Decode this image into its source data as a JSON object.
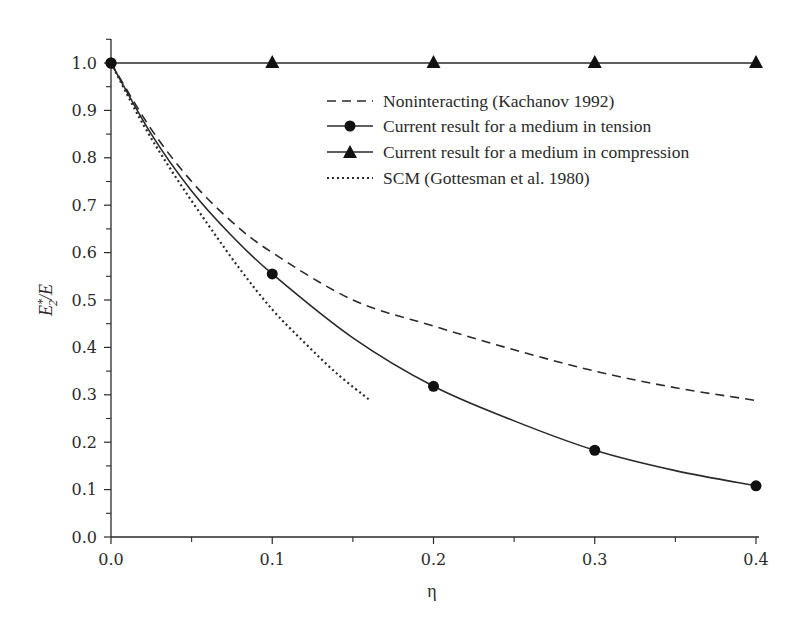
{
  "chart_data": {
    "type": "line",
    "title": "",
    "xlabel": "η",
    "ylabel": "E*₂/E",
    "ylabel_parts": {
      "base": "E",
      "sup": "*",
      "sub": "2",
      "rest": "/E"
    },
    "xlim": [
      0.0,
      0.4
    ],
    "ylim": [
      0.0,
      1.0
    ],
    "grid": false,
    "legend_position": "upper right (inside)",
    "x_ticks": [
      "0.0",
      "0.1",
      "0.2",
      "0.3",
      "0.4"
    ],
    "y_ticks": [
      "0.0",
      "0.1",
      "0.2",
      "0.3",
      "0.4",
      "0.5",
      "0.6",
      "0.7",
      "0.8",
      "0.9",
      "1.0"
    ],
    "series": [
      {
        "name": "Noninteracting (Kachanov 1992)",
        "style": "dashed",
        "marker": "none",
        "x": [
          0.0,
          0.025,
          0.05,
          0.075,
          0.1,
          0.15,
          0.2,
          0.25,
          0.3,
          0.35,
          0.4
        ],
        "y": [
          1.0,
          0.86,
          0.75,
          0.665,
          0.6,
          0.5,
          0.445,
          0.395,
          0.35,
          0.315,
          0.288
        ]
      },
      {
        "name": "Current result for a medium in tension",
        "style": "solid",
        "marker": "circle",
        "x": [
          0.0,
          0.025,
          0.05,
          0.075,
          0.1,
          0.15,
          0.2,
          0.25,
          0.3,
          0.35,
          0.4
        ],
        "y": [
          1.0,
          0.85,
          0.73,
          0.635,
          0.555,
          0.42,
          0.318,
          0.245,
          0.183,
          0.14,
          0.108
        ],
        "marker_x": [
          0.0,
          0.1,
          0.2,
          0.3,
          0.4
        ],
        "marker_y": [
          1.0,
          0.555,
          0.318,
          0.183,
          0.108
        ]
      },
      {
        "name": "Current result for a medium in compression",
        "style": "solid",
        "marker": "triangle",
        "x": [
          0.0,
          0.1,
          0.2,
          0.3,
          0.4
        ],
        "y": [
          1.0,
          1.0,
          1.0,
          1.0,
          1.0
        ],
        "marker_x": [
          0.1,
          0.2,
          0.3,
          0.4
        ],
        "marker_y": [
          1.0,
          1.0,
          1.0,
          1.0
        ]
      },
      {
        "name": "SCM (Gottesman et al. 1980)",
        "style": "dotted",
        "marker": "none",
        "x": [
          0.0,
          0.02,
          0.04,
          0.06,
          0.08,
          0.1,
          0.12,
          0.14,
          0.16
        ],
        "y": [
          1.0,
          0.87,
          0.76,
          0.66,
          0.565,
          0.48,
          0.41,
          0.345,
          0.29
        ]
      }
    ]
  },
  "colors": {
    "ink": "#2a2a2a",
    "background": "#ffffff"
  }
}
